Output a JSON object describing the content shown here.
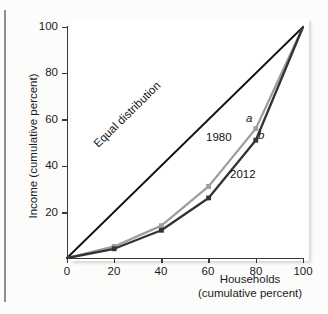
{
  "chart_data": {
    "type": "line",
    "title": "",
    "xlabel": "Households\n(cumulative percent)",
    "xlabel_line1": "Households",
    "xlabel_line2": "(cumulative percent)",
    "ylabel": "Income (cumulative percent)",
    "xlim": [
      0,
      100
    ],
    "ylim": [
      0,
      100
    ],
    "grid": false,
    "legend_position": "inline-annotations",
    "xticks": [
      0,
      20,
      40,
      60,
      80,
      100
    ],
    "xtick_labels": [
      "0",
      "20",
      "40",
      "60",
      "80",
      "100"
    ],
    "yticks": [
      20,
      40,
      60,
      80,
      100
    ],
    "ytick_labels": [
      "20",
      "40",
      "60",
      "80",
      "100"
    ],
    "x": [
      0,
      20,
      40,
      60,
      80,
      100
    ],
    "series": [
      {
        "name": "Equal distribution",
        "label": "Equal distribution",
        "color": "#111111",
        "x": [
          0,
          100
        ],
        "values": [
          0,
          100
        ],
        "markers": false
      },
      {
        "name": "1980",
        "label": "1980",
        "color": "#9d9d9d",
        "x": [
          0,
          20,
          40,
          60,
          80,
          100
        ],
        "values": [
          0,
          5,
          14,
          31,
          56,
          100
        ],
        "markers": true
      },
      {
        "name": "2012",
        "label": "2012",
        "color": "#333333",
        "x": [
          0,
          20,
          40,
          60,
          80,
          100
        ],
        "values": [
          0,
          4,
          12,
          26,
          51,
          100
        ],
        "markers": true
      }
    ],
    "annotations": [
      {
        "text": "a",
        "series": "1980",
        "x": 80,
        "y": 56,
        "style": "italic"
      },
      {
        "text": "b",
        "series": "2012",
        "x": 80,
        "y": 51,
        "style": "italic"
      },
      {
        "text": "1980",
        "x": 58,
        "y": 44,
        "style": "normal"
      },
      {
        "text": "2012",
        "x": 69,
        "y": 28,
        "style": "normal"
      },
      {
        "text": "Equal distribution",
        "x": 28,
        "y": 33,
        "style": "rotated"
      }
    ]
  },
  "axes": {
    "y_title": "Income (cumulative percent)",
    "x_title_line1": "Households",
    "x_title_line2": "(cumulative percent)",
    "x_tick_labels": [
      "0",
      "20",
      "40",
      "60",
      "80",
      "100"
    ],
    "y_tick_labels": [
      "100",
      "80",
      "60",
      "40",
      "20"
    ]
  },
  "labels": {
    "equal_distribution": "Equal distribution",
    "series_1980": "1980",
    "series_2012": "2012",
    "point_a": "a",
    "point_b": "b"
  },
  "colors": {
    "equal_line": "#111111",
    "line_1980": "#9d9d9d",
    "line_2012": "#333333",
    "axis": "#3a3a3a",
    "panel_background": "#ffffff",
    "page_background": "#fcfcfb",
    "left_rule": "#8e8e8e"
  }
}
